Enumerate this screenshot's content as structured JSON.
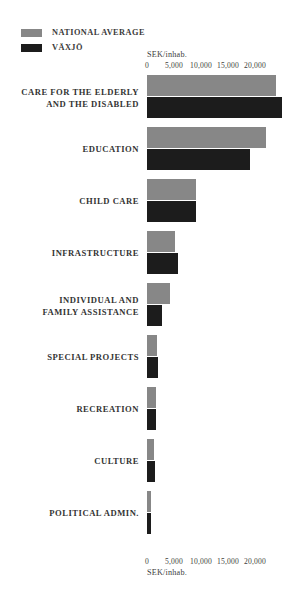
{
  "legend": {
    "items": [
      {
        "label": "NATIONAL AVERAGE",
        "color": "#878787",
        "key": "national"
      },
      {
        "label": "VÄXJÖ",
        "color": "#1c1c1c",
        "key": "vaxjo"
      }
    ]
  },
  "axis": {
    "unit_label": "SEK/inhab.",
    "ticks": [
      "0",
      "5,000",
      "10,000",
      "15,000",
      "20,000"
    ]
  },
  "colors": {
    "national_average": "#878787",
    "vaxjo": "#1c1c1c",
    "background": "#ffffff",
    "text": "#333333"
  },
  "chart_data": {
    "type": "bar",
    "orientation": "horizontal",
    "title": "",
    "subtitle": "",
    "xlabel": "SEK/inhab.",
    "ylabel": "",
    "xlim": [
      0,
      25000
    ],
    "xticks": [
      0,
      5000,
      10000,
      15000,
      20000
    ],
    "xtick_labels": [
      "0",
      "5,000",
      "10,000",
      "15,000",
      "20,000"
    ],
    "grid": false,
    "legend_position": "top-left",
    "categories": [
      "CARE FOR THE ELDERLY\nAND THE DISABLED",
      "EDUCATION",
      "CHILD CARE",
      "INFRASTRUCTURE",
      "INDIVIDUAL AND\nFAMILY ASSISTANCE",
      "SPECIAL PROJECTS",
      "RECREATION",
      "CULTURE",
      "POLITICAL ADMIN."
    ],
    "series": [
      {
        "name": "NATIONAL AVERAGE",
        "color": "#878787",
        "values": [
          23900,
          22000,
          9100,
          5200,
          4300,
          1900,
          1700,
          1300,
          700
        ]
      },
      {
        "name": "VÄXJÖ",
        "color": "#1c1c1c",
        "values": [
          25000,
          19100,
          9100,
          5700,
          2800,
          2000,
          1700,
          1400,
          700
        ]
      }
    ]
  }
}
